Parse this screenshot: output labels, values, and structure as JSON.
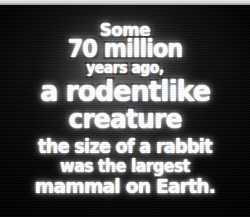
{
  "image": {
    "kind": "image-macro",
    "background_color": "#060606",
    "text_color": "#ffffff",
    "outline_color": "#000000",
    "glow_color": "#ffffff"
  },
  "caption": {
    "full_text": "Some 70 million years ago, a rodentlike creature the size of a rabbit was the largest mammal on Earth.",
    "lines": [
      {
        "id": "some",
        "text": "Some"
      },
      {
        "id": "seventy-million",
        "text": "70 million"
      },
      {
        "id": "years-ago",
        "text": "years ago,"
      },
      {
        "id": "a-rodentlike",
        "text": "a rodentlike"
      },
      {
        "id": "creature",
        "text": "creature"
      },
      {
        "id": "the-size-of-a-rabbit",
        "text": "the size of a rabbit"
      },
      {
        "id": "was-the-largest",
        "text": "was the largest"
      },
      {
        "id": "mammal-on-earth",
        "text": "mammal on Earth."
      }
    ]
  }
}
